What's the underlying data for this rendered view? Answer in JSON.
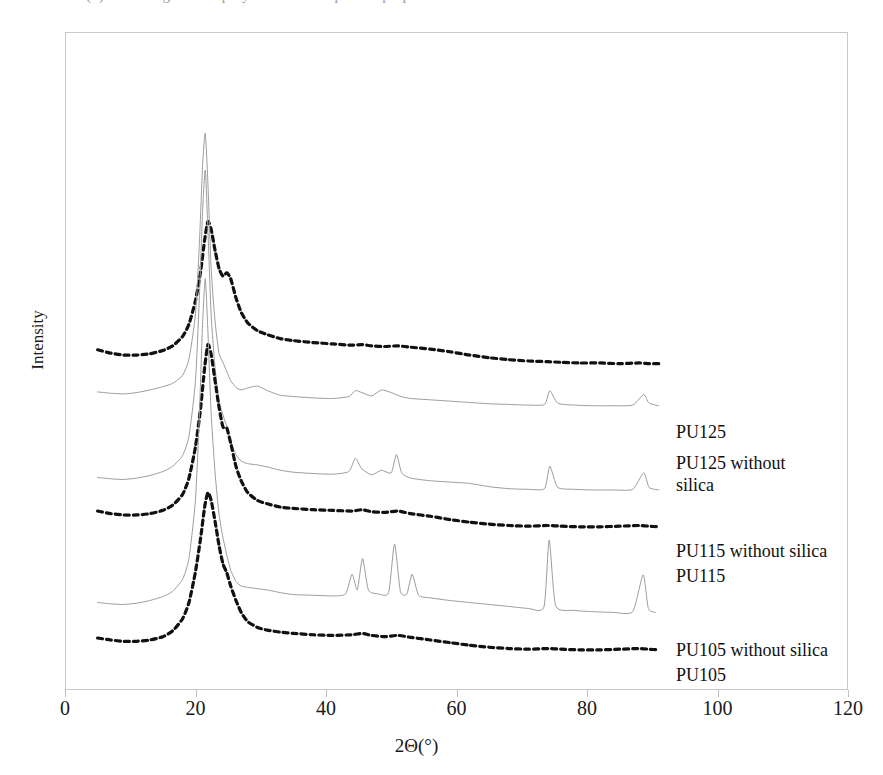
{
  "figure": {
    "top_clipped_text": "(b) diffractograms of polyurethane composites prepared with silica",
    "background_color": "#ffffff",
    "frame_color": "#c9c9c9"
  },
  "axes": {
    "y": {
      "title": "Intensity",
      "ticks": [],
      "range_note": "arbitrary units, curves vertically offset"
    },
    "x": {
      "title": "2Θ(°)",
      "ticks": [
        0,
        20,
        40,
        60,
        80,
        100,
        120
      ],
      "tick_labels": [
        "0",
        "20",
        "40",
        "60",
        "80",
        "100",
        "120"
      ],
      "min": 0,
      "max": 120
    }
  },
  "curve_labels": [
    {
      "text": "PU125",
      "style": "dashed",
      "color": "#111111"
    },
    {
      "text": "PU125 without silica",
      "style": "solid",
      "color": "#9c9c9c"
    },
    {
      "text": "PU115 without silica",
      "style": "solid",
      "color": "#9c9c9c"
    },
    {
      "text": "PU115",
      "style": "dashed",
      "color": "#111111"
    },
    {
      "text": "PU105 without silica",
      "style": "solid",
      "color": "#9c9c9c"
    },
    {
      "text": "PU105",
      "style": "dashed",
      "color": "#111111"
    }
  ],
  "chart_data": {
    "type": "line",
    "title": "",
    "xlabel": "2Θ(°)",
    "ylabel": "Intensity",
    "xlim": [
      0,
      120
    ],
    "ylim": [
      0,
      1
    ],
    "grid": false,
    "legend_position": "inline-right-of-curve-ends",
    "series": [
      {
        "name": "PU125",
        "style": "dashed",
        "color": "#111111",
        "baseline": 0.495,
        "x": [
          5,
          7,
          9,
          11,
          13,
          15,
          16.5,
          18,
          19,
          20,
          20.8,
          21.4,
          21.9,
          22.4,
          23,
          23.6,
          24.2,
          24.8,
          25.4,
          26.2,
          27,
          28,
          29.5,
          31,
          33,
          35,
          38,
          41,
          44,
          45.5,
          47,
          49,
          51,
          53,
          56,
          59,
          62,
          65,
          68,
          71,
          74,
          76,
          79,
          82,
          85,
          88,
          89.5,
          91
        ],
        "y": [
          0.517,
          0.512,
          0.509,
          0.509,
          0.511,
          0.516,
          0.523,
          0.537,
          0.556,
          0.592,
          0.637,
          0.684,
          0.712,
          0.7,
          0.668,
          0.641,
          0.629,
          0.634,
          0.625,
          0.596,
          0.574,
          0.558,
          0.546,
          0.54,
          0.534,
          0.531,
          0.528,
          0.526,
          0.524,
          0.525,
          0.523,
          0.522,
          0.523,
          0.521,
          0.518,
          0.514,
          0.509,
          0.505,
          0.502,
          0.5,
          0.499,
          0.498,
          0.497,
          0.497,
          0.496,
          0.497,
          0.496,
          0.496
        ]
      },
      {
        "name": "PU125 without silica",
        "style": "solid",
        "color": "#9c9c9c",
        "baseline": 0.432,
        "x": [
          5,
          7,
          9,
          11,
          13,
          15,
          16.5,
          18,
          19,
          20,
          20.6,
          21.1,
          21.5,
          21.9,
          22.4,
          23,
          23.6,
          24.2,
          24.8,
          25.4,
          26.2,
          27,
          28,
          29.5,
          31,
          33,
          35,
          38,
          41,
          43.5,
          44.5,
          45.5,
          47,
          48.5,
          50,
          51.5,
          53,
          56,
          59,
          62,
          65,
          68,
          71,
          73.5,
          74.3,
          75.5,
          78,
          81,
          84,
          87,
          88.7,
          89.5,
          91
        ],
        "y": [
          0.453,
          0.451,
          0.45,
          0.452,
          0.456,
          0.461,
          0.466,
          0.478,
          0.503,
          0.572,
          0.68,
          0.8,
          0.846,
          0.77,
          0.64,
          0.56,
          0.512,
          0.498,
          0.484,
          0.47,
          0.46,
          0.456,
          0.459,
          0.462,
          0.455,
          0.448,
          0.446,
          0.444,
          0.443,
          0.446,
          0.455,
          0.452,
          0.447,
          0.456,
          0.452,
          0.446,
          0.443,
          0.441,
          0.439,
          0.437,
          0.435,
          0.434,
          0.433,
          0.434,
          0.455,
          0.436,
          0.433,
          0.432,
          0.432,
          0.433,
          0.449,
          0.436,
          0.432
        ]
      },
      {
        "name": "PU115 without silica",
        "style": "solid",
        "color": "#9c9c9c",
        "baseline": 0.303,
        "x": [
          5,
          7,
          9,
          11,
          13,
          15,
          16.5,
          18,
          19,
          20,
          20.6,
          21.1,
          21.5,
          21.9,
          22.4,
          23,
          23.6,
          24.2,
          24.8,
          25.4,
          26.2,
          27,
          28,
          29.5,
          31,
          33,
          35,
          38,
          41,
          43.5,
          44.5,
          45.5,
          47,
          48.5,
          50,
          50.8,
          51.6,
          53,
          56,
          59,
          62,
          65,
          68,
          71,
          73.5,
          74.3,
          75.5,
          78,
          81,
          84,
          87,
          88.7,
          89.5,
          91
        ],
        "y": [
          0.323,
          0.321,
          0.32,
          0.322,
          0.326,
          0.332,
          0.34,
          0.356,
          0.386,
          0.47,
          0.6,
          0.73,
          0.79,
          0.7,
          0.57,
          0.49,
          0.44,
          0.418,
          0.4,
          0.378,
          0.358,
          0.348,
          0.344,
          0.342,
          0.339,
          0.334,
          0.331,
          0.329,
          0.328,
          0.332,
          0.352,
          0.336,
          0.327,
          0.334,
          0.33,
          0.358,
          0.33,
          0.322,
          0.318,
          0.316,
          0.314,
          0.309,
          0.306,
          0.305,
          0.306,
          0.34,
          0.308,
          0.305,
          0.304,
          0.304,
          0.305,
          0.33,
          0.308,
          0.304
        ]
      },
      {
        "name": "PU115",
        "style": "dashed",
        "color": "#111111",
        "baseline": 0.248,
        "x": [
          5,
          7,
          9,
          11,
          13,
          15,
          16.5,
          18,
          19,
          20,
          20.8,
          21.4,
          21.9,
          22.4,
          23,
          23.6,
          24.2,
          24.8,
          25.4,
          26.2,
          27,
          28,
          29.5,
          31,
          33,
          35,
          38,
          41,
          44,
          45.5,
          47,
          49,
          51,
          53,
          56,
          59,
          62,
          65,
          68,
          71,
          74,
          76,
          79,
          82,
          85,
          88,
          89.5,
          91
        ],
        "y": [
          0.272,
          0.268,
          0.266,
          0.266,
          0.268,
          0.273,
          0.281,
          0.297,
          0.322,
          0.37,
          0.43,
          0.49,
          0.525,
          0.51,
          0.47,
          0.43,
          0.4,
          0.398,
          0.375,
          0.34,
          0.318,
          0.3,
          0.288,
          0.283,
          0.278,
          0.276,
          0.274,
          0.273,
          0.272,
          0.274,
          0.271,
          0.27,
          0.272,
          0.268,
          0.264,
          0.259,
          0.255,
          0.252,
          0.25,
          0.249,
          0.25,
          0.249,
          0.248,
          0.248,
          0.249,
          0.25,
          0.249,
          0.248
        ]
      },
      {
        "name": "PU105 without silica",
        "style": "solid",
        "color": "#9c9c9c",
        "baseline": 0.115,
        "x": [
          5,
          7,
          9,
          11,
          13,
          15,
          16.5,
          18,
          19,
          20,
          20.6,
          21.1,
          21.5,
          21.9,
          22.4,
          23,
          23.6,
          24.2,
          24.8,
          25.4,
          26.2,
          27,
          28,
          29.5,
          31,
          33,
          35,
          38,
          41,
          43,
          44,
          44.8,
          45.6,
          46.5,
          48,
          49.6,
          50.5,
          51.4,
          52.4,
          53.2,
          54.2,
          56,
          59,
          62,
          65,
          68,
          71,
          73.4,
          74.2,
          75.2,
          78,
          81,
          84,
          87,
          88.6,
          89.4,
          90.5
        ],
        "y": [
          0.133,
          0.131,
          0.13,
          0.132,
          0.136,
          0.142,
          0.15,
          0.168,
          0.2,
          0.29,
          0.42,
          0.56,
          0.625,
          0.545,
          0.42,
          0.33,
          0.268,
          0.232,
          0.205,
          0.182,
          0.165,
          0.158,
          0.156,
          0.154,
          0.152,
          0.148,
          0.145,
          0.144,
          0.143,
          0.146,
          0.176,
          0.152,
          0.2,
          0.152,
          0.146,
          0.148,
          0.222,
          0.15,
          0.146,
          0.176,
          0.144,
          0.14,
          0.136,
          0.133,
          0.13,
          0.127,
          0.124,
          0.126,
          0.228,
          0.128,
          0.121,
          0.119,
          0.118,
          0.119,
          0.175,
          0.124,
          0.118
        ]
      },
      {
        "name": "PU105",
        "style": "dashed",
        "color": "#111111",
        "baseline": 0.06,
        "x": [
          5,
          7,
          9,
          11,
          13,
          15,
          16.5,
          18,
          19,
          20,
          20.8,
          21.4,
          21.9,
          22.4,
          23,
          23.6,
          24.2,
          24.8,
          25.4,
          26.2,
          27,
          28,
          29.5,
          31,
          33,
          35,
          38,
          41,
          44,
          45.5,
          47,
          49,
          51,
          53,
          56,
          59,
          62,
          65,
          68,
          71,
          74,
          76,
          79,
          82,
          85,
          88,
          89.5,
          91
        ],
        "y": [
          0.079,
          0.076,
          0.074,
          0.074,
          0.076,
          0.081,
          0.09,
          0.108,
          0.133,
          0.18,
          0.232,
          0.278,
          0.3,
          0.288,
          0.256,
          0.22,
          0.192,
          0.178,
          0.158,
          0.136,
          0.118,
          0.104,
          0.095,
          0.091,
          0.088,
          0.086,
          0.084,
          0.083,
          0.084,
          0.086,
          0.083,
          0.081,
          0.083,
          0.08,
          0.076,
          0.072,
          0.068,
          0.065,
          0.063,
          0.062,
          0.063,
          0.062,
          0.061,
          0.061,
          0.062,
          0.063,
          0.062,
          0.061
        ]
      }
    ]
  },
  "label_positions": [
    {
      "key": "pu125",
      "left": 676,
      "top": 421,
      "wrapped": false
    },
    {
      "key": "pu125_ws",
      "left": 676,
      "top": 452,
      "wrapped": true
    },
    {
      "key": "pu115_ws",
      "left": 676,
      "top": 540,
      "wrapped": false
    },
    {
      "key": "pu115",
      "left": 676,
      "top": 565,
      "wrapped": false
    },
    {
      "key": "pu105_ws",
      "left": 676,
      "top": 639,
      "wrapped": false
    },
    {
      "key": "pu105",
      "left": 676,
      "top": 664,
      "wrapped": false
    }
  ]
}
